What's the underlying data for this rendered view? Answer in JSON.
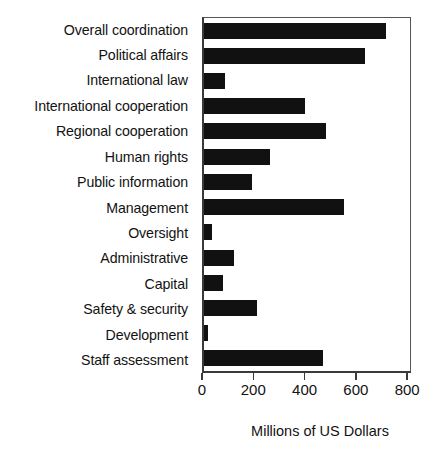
{
  "chart_data": {
    "type": "bar",
    "orientation": "horizontal",
    "title": "",
    "subtitle": "",
    "xlabel": "Millions of US Dollars",
    "ylabel": "",
    "xlim": [
      0,
      815
    ],
    "xticks": [
      0,
      200,
      400,
      600,
      800
    ],
    "xtick_labels": [
      "0",
      "200",
      "400",
      "600",
      "800"
    ],
    "grid": false,
    "legend": false,
    "legend_position": "none",
    "bar_color": "#111111",
    "axis_color": "#3a3a3a",
    "categories": [
      "Overall coordination",
      "Political affairs",
      "International law",
      "International cooperation",
      "Regional cooperation",
      "Human rights",
      "Public information",
      "Management",
      "Oversight",
      "Administrative",
      "Capital",
      "Safety & security",
      "Development",
      "Staff assessment"
    ],
    "values": [
      720,
      635,
      85,
      398,
      483,
      261,
      191,
      553,
      31,
      117,
      74,
      210,
      16,
      472
    ],
    "series": [
      {
        "name": "Budget",
        "values": [
          720,
          635,
          85,
          398,
          483,
          261,
          191,
          553,
          31,
          117,
          74,
          210,
          16,
          472
        ]
      }
    ]
  }
}
